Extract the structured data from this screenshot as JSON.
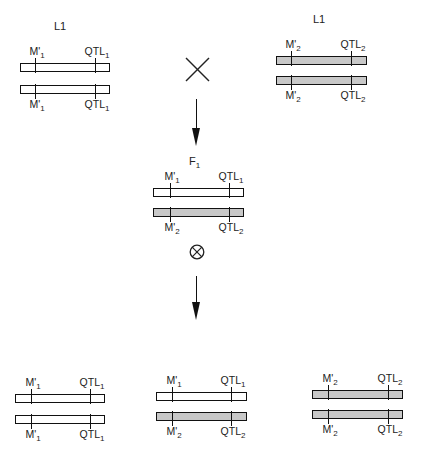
{
  "diagram": {
    "colors": {
      "line1_chromosome": "#ffffff",
      "line2_chromosome": "#c8c8c8",
      "stroke": "#111111"
    },
    "symbols": {
      "cross": "×",
      "self": "⊗"
    },
    "parents": [
      {
        "label": "L1",
        "label_pos": [
          54,
          20
        ],
        "chromosomes": [
          {
            "fill": "white",
            "x": 20,
            "y": 63,
            "w": 90,
            "marker": {
              "name": "M'",
              "sub": "1",
              "x": 35
            },
            "qtl": {
              "name": "QTL",
              "sub": "1",
              "x": 95
            },
            "label_side": "top"
          },
          {
            "fill": "white",
            "x": 20,
            "y": 85,
            "w": 90,
            "marker": {
              "name": "M'",
              "sub": "1",
              "x": 35
            },
            "qtl": {
              "name": "QTL",
              "sub": "1",
              "x": 95
            },
            "label_side": "bottom"
          }
        ]
      },
      {
        "label": "L1",
        "label_pos": [
          313,
          13
        ],
        "chromosomes": [
          {
            "fill": "grey",
            "x": 276,
            "y": 56,
            "w": 91,
            "marker": {
              "name": "M'",
              "sub": "2",
              "x": 291
            },
            "qtl": {
              "name": "QTL",
              "sub": "2",
              "x": 351
            },
            "label_side": "top"
          },
          {
            "fill": "grey",
            "x": 276,
            "y": 76,
            "w": 91,
            "marker": {
              "name": "M'",
              "sub": "2",
              "x": 291
            },
            "qtl": {
              "name": "QTL",
              "sub": "2",
              "x": 351
            },
            "label_side": "bottom"
          }
        ]
      }
    ],
    "f1": {
      "label": "F",
      "label_sub": "1",
      "label_pos": [
        189,
        155
      ],
      "chromosomes": [
        {
          "fill": "white",
          "x": 153,
          "y": 188,
          "w": 91,
          "marker": {
            "name": "M'",
            "sub": "1",
            "x": 170
          },
          "qtl": {
            "name": "QTL",
            "sub": "1",
            "x": 229
          },
          "label_side": "top"
        },
        {
          "fill": "grey",
          "x": 153,
          "y": 208,
          "w": 91,
          "marker": {
            "name": "M'",
            "sub": "2",
            "x": 170
          },
          "qtl": {
            "name": "QTL",
            "sub": "2",
            "x": 229
          },
          "label_side": "bottom"
        }
      ]
    },
    "progeny": [
      {
        "genotype": "M'1 QTL1 / M'1 QTL1",
        "chromosomes": [
          {
            "fill": "white",
            "x": 15,
            "y": 394,
            "w": 90,
            "marker": {
              "name": "M'",
              "sub": "1",
              "x": 31
            },
            "qtl": {
              "name": "QTL",
              "sub": "1",
              "x": 90
            },
            "label_side": "top"
          },
          {
            "fill": "white",
            "x": 15,
            "y": 415,
            "w": 90,
            "marker": {
              "name": "M'",
              "sub": "1",
              "x": 31
            },
            "qtl": {
              "name": "QTL",
              "sub": "1",
              "x": 90
            },
            "label_side": "bottom"
          }
        ]
      },
      {
        "genotype": "M'1 QTL1 / M'2 QTL2",
        "chromosomes": [
          {
            "fill": "white",
            "x": 156,
            "y": 392,
            "w": 91,
            "marker": {
              "name": "M'",
              "sub": "1",
              "x": 172
            },
            "qtl": {
              "name": "QTL",
              "sub": "1",
              "x": 231
            },
            "label_side": "top"
          },
          {
            "fill": "grey",
            "x": 156,
            "y": 412,
            "w": 91,
            "marker": {
              "name": "M'",
              "sub": "2",
              "x": 172
            },
            "qtl": {
              "name": "QTL",
              "sub": "2",
              "x": 231
            },
            "label_side": "bottom"
          }
        ]
      },
      {
        "genotype": "M'2 QTL2 / M'2 QTL2",
        "chromosomes": [
          {
            "fill": "grey",
            "x": 312,
            "y": 390,
            "w": 91,
            "marker": {
              "name": "M'",
              "sub": "2",
              "x": 328
            },
            "qtl": {
              "name": "QTL",
              "sub": "2",
              "x": 388
            },
            "label_side": "top"
          },
          {
            "fill": "grey",
            "x": 312,
            "y": 410,
            "w": 91,
            "marker": {
              "name": "M'",
              "sub": "2",
              "x": 328
            },
            "qtl": {
              "name": "QTL",
              "sub": "2",
              "x": 388
            },
            "label_side": "bottom"
          }
        ]
      }
    ]
  }
}
